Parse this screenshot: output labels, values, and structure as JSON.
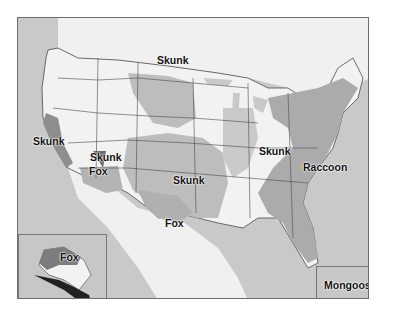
{
  "map": {
    "title": "",
    "colors": {
      "ocean": "#c9c9c9",
      "land_unaffected": "#f2f2f2",
      "skunk_region": "#bdbdbd",
      "raccoon_region": "#aaaaaa",
      "fox_region": "#b5b5b5",
      "skunk_dark_variant": "#7a7a7a",
      "fox_dark_variant": "#6f6f6f",
      "state_borders": "#4a4a4a"
    },
    "labels": [
      {
        "id": "skunk-north-central",
        "text": "Skunk"
      },
      {
        "id": "skunk-california",
        "text": "Skunk"
      },
      {
        "id": "skunk-arizona",
        "text": "Skunk"
      },
      {
        "id": "fox-arizona",
        "text": "Fox"
      },
      {
        "id": "skunk-south-central",
        "text": "Skunk"
      },
      {
        "id": "fox-texas",
        "text": "Fox"
      },
      {
        "id": "skunk-midwest",
        "text": "Skunk"
      },
      {
        "id": "raccoon-east",
        "text": "Raccoon"
      },
      {
        "id": "fox-alaska",
        "text": "Fox"
      },
      {
        "id": "mongoose-hawaii",
        "text": "Mongoose"
      }
    ],
    "insets": {
      "alaska": {
        "label": "Fox"
      },
      "hawaii": {
        "label": "Mongoose"
      }
    }
  }
}
